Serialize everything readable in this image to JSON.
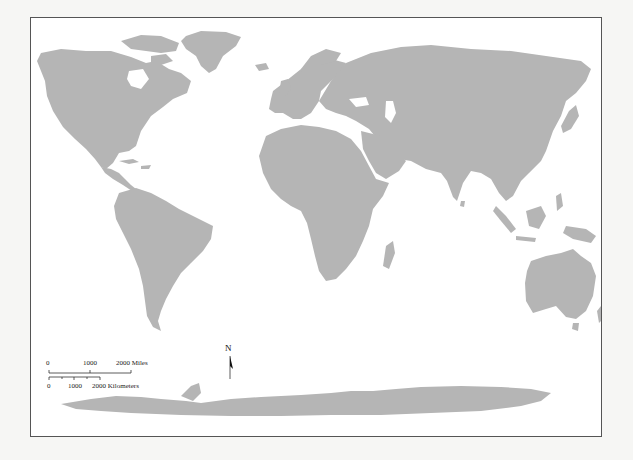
{
  "map": {
    "type": "world-outline",
    "projection": "equirectangular-like",
    "land_color": "#b5b5b5",
    "water_color": "#ffffff",
    "frame_color": "#555555",
    "regions": [
      "North America",
      "South America",
      "Europe",
      "Africa",
      "Asia",
      "Australia",
      "Antarctica",
      "Greenland"
    ]
  },
  "scale_bar": {
    "miles": {
      "labels": [
        "0",
        "1000",
        "2000 Miles"
      ]
    },
    "kilometers": {
      "labels": [
        "0",
        "1000",
        "2000 Kilometers"
      ]
    }
  },
  "north_arrow": {
    "label": "N"
  }
}
